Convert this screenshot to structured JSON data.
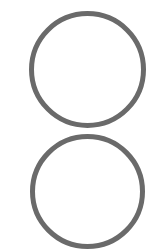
{
  "canvas": {
    "width": 159,
    "height": 249,
    "background": "#ffffff"
  },
  "shapes": [
    {
      "id": "circle-top",
      "type": "circle",
      "cx": 87,
      "cy": 69,
      "diameter": 117,
      "stroke_width": 5,
      "stroke": "#6a6a6a",
      "fill": "none"
    },
    {
      "id": "circle-bottom",
      "type": "circle",
      "cx": 87,
      "cy": 191,
      "diameter": 115,
      "stroke_width": 5,
      "stroke": "#6a6a6a",
      "fill": "none"
    }
  ]
}
